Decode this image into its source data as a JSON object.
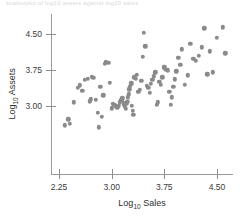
{
  "caption": {
    "cropped_line": "scatterplot  of  log10  assets  against  log10  sales"
  },
  "chart_data": {
    "type": "scatter",
    "title": "",
    "subtitle": "",
    "xlabel": "Log10 Sales",
    "ylabel": "Log10 Assets",
    "xlabel_base": "Log",
    "xlabel_sub": "10",
    "xlabel_rest": " Sales",
    "ylabel_base": "Log",
    "ylabel_sub": "10",
    "ylabel_rest": " Assets",
    "xlim": [
      2.1,
      4.75
    ],
    "ylim": [
      2.5,
      4.75
    ],
    "xticks": [
      "2.25",
      "3.00",
      "3.75",
      "4.50"
    ],
    "xtick_values": [
      2.25,
      3.0,
      3.75,
      4.5
    ],
    "yticks": [
      "3.00",
      "3.75",
      "4.50"
    ],
    "ytick_values": [
      3.0,
      3.75,
      4.5
    ],
    "grid": false,
    "legend": "none",
    "marker": "filled-circle",
    "marker_color": "#8a8a8a",
    "axis_color": "#9a9a9a",
    "n_points": 96,
    "x": [
      2.38,
      2.4,
      2.33,
      2.46,
      2.52,
      2.55,
      2.58,
      2.62,
      2.66,
      2.69,
      2.7,
      2.72,
      2.74,
      2.77,
      2.8,
      2.82,
      2.84,
      2.86,
      2.88,
      2.9,
      2.92,
      2.95,
      2.97,
      3.0,
      3.02,
      3.04,
      3.06,
      3.08,
      3.1,
      3.12,
      3.14,
      3.15,
      3.17,
      3.18,
      3.19,
      3.2,
      3.21,
      3.22,
      3.23,
      3.24,
      3.25,
      3.26,
      3.27,
      3.28,
      3.29,
      3.3,
      3.31,
      3.32,
      3.34,
      3.36,
      3.38,
      3.4,
      3.42,
      3.44,
      3.46,
      3.48,
      3.5,
      3.52,
      3.54,
      3.56,
      3.58,
      3.6,
      3.62,
      3.64,
      3.66,
      3.68,
      3.7,
      3.72,
      3.74,
      3.75,
      3.76,
      3.78,
      3.8,
      3.82,
      3.84,
      3.86,
      3.88,
      3.9,
      3.92,
      3.95,
      3.98,
      4.0,
      4.04,
      4.08,
      4.12,
      4.16,
      4.2,
      4.24,
      4.28,
      4.32,
      4.36,
      4.4,
      4.44,
      4.5,
      4.58,
      4.62
    ],
    "y": [
      2.72,
      2.63,
      2.6,
      3.08,
      3.38,
      3.43,
      3.32,
      3.55,
      3.57,
      3.1,
      3.14,
      3.61,
      3.59,
      3.13,
      2.86,
      2.56,
      3.4,
      2.78,
      3.22,
      3.88,
      3.92,
      3.9,
      3.48,
      2.95,
      3.04,
      3.02,
      2.99,
      2.97,
      3.0,
      3.08,
      3.12,
      3.16,
      3.07,
      3.03,
      2.98,
      2.94,
      3.05,
      3.09,
      3.18,
      3.24,
      3.35,
      3.4,
      3.44,
      3.47,
      3.0,
      2.9,
      2.82,
      3.6,
      3.57,
      3.65,
      3.3,
      3.34,
      3.52,
      4.02,
      4.52,
      4.24,
      3.42,
      3.38,
      3.28,
      3.46,
      3.54,
      3.62,
      3.7,
      3.02,
      3.08,
      3.5,
      3.44,
      3.6,
      3.8,
      3.82,
      3.78,
      3.76,
      3.74,
      3.3,
      3.02,
      3.18,
      3.4,
      3.56,
      3.72,
      4.0,
      3.86,
      4.18,
      3.44,
      3.64,
      4.3,
      3.98,
      3.94,
      4.04,
      4.22,
      4.62,
      3.66,
      4.14,
      3.7,
      4.42,
      4.64,
      4.1
    ]
  }
}
